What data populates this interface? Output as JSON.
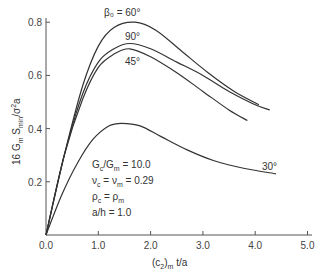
{
  "chart_data": {
    "type": "line",
    "title": "",
    "xlabel": "(c2)m t/a",
    "ylabel": "16 Gm Smin / σ²a",
    "xlim": [
      0.0,
      5.0
    ],
    "ylim": [
      0.0,
      0.85
    ],
    "x_ticks": [
      "0.0",
      "1.0",
      "2.0",
      "3.0",
      "4.0",
      "5.0"
    ],
    "y_ticks": [
      "0.2",
      "0.4",
      "0.6",
      "0.8"
    ],
    "grid": false,
    "legend_position": "inline labels",
    "series": [
      {
        "name": "β0 = 60°",
        "x": [
          0.0,
          0.35,
          0.7,
          1.0,
          1.3,
          1.7,
          2.1,
          2.6,
          3.1,
          3.6,
          4.07
        ],
        "y": [
          0.0,
          0.3,
          0.56,
          0.71,
          0.78,
          0.8,
          0.77,
          0.69,
          0.61,
          0.54,
          0.49
        ]
      },
      {
        "name": "90°",
        "x": [
          0.0,
          0.35,
          0.7,
          1.0,
          1.3,
          1.6,
          2.0,
          2.5,
          3.0,
          3.5,
          4.0,
          4.28
        ],
        "y": [
          0.0,
          0.3,
          0.53,
          0.65,
          0.7,
          0.72,
          0.7,
          0.65,
          0.6,
          0.54,
          0.49,
          0.47
        ]
      },
      {
        "name": "45°",
        "x": [
          0.0,
          0.35,
          0.7,
          1.0,
          1.3,
          1.6,
          2.0,
          2.5,
          3.0,
          3.5,
          3.85
        ],
        "y": [
          0.0,
          0.3,
          0.51,
          0.63,
          0.68,
          0.7,
          0.67,
          0.61,
          0.54,
          0.47,
          0.43
        ]
      },
      {
        "name": "30°",
        "x": [
          0.0,
          0.3,
          0.6,
          0.9,
          1.2,
          1.45,
          1.8,
          2.2,
          2.7,
          3.2,
          3.8,
          4.4
        ],
        "y": [
          0.0,
          0.15,
          0.27,
          0.36,
          0.41,
          0.42,
          0.41,
          0.37,
          0.32,
          0.28,
          0.25,
          0.23
        ]
      }
    ],
    "curve_labels": {
      "s60": "β₀ = 60°",
      "s90": "90°",
      "s45": "45°",
      "s30": "30°"
    },
    "annotations": [
      "Gc/Gm = 10.0",
      "νc = νm = 0.29",
      "ρc = ρm",
      "a/h = 1.0"
    ]
  },
  "axes": {
    "y_label_main": "16 G",
    "y_label_sub1": "m",
    "y_label_mid": " S",
    "y_label_sub2": "min",
    "y_label_end": "/σ",
    "y_label_sup": "2",
    "y_label_tail": "a",
    "x_label_pre": "(c",
    "x_label_sub1": "2",
    "x_label_mid": ")",
    "x_label_sub2": "m",
    "x_label_tail": " t/a"
  },
  "annotation_parts": {
    "line1_a": "G",
    "line1_sub_a": "c",
    "line1_b": "/G",
    "line1_sub_b": "m",
    "line1_c": " = 10.0",
    "line2_a": "ν",
    "line2_sub_a": "c",
    "line2_b": " = ν",
    "line2_sub_b": "m",
    "line2_c": " = 0.29",
    "line3_a": "ρ",
    "line3_sub_a": "c",
    "line3_b": " = ρ",
    "line3_sub_b": "m",
    "line4": "a/h = 1.0"
  }
}
